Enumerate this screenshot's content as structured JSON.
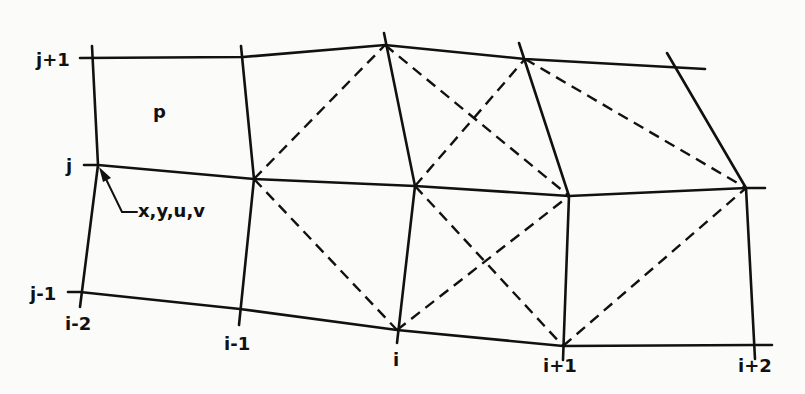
{
  "labels": {
    "row_top": "j+1",
    "row_mid": "j",
    "row_bot": "j-1",
    "col_0": "i-2",
    "col_1": "i-1",
    "col_2": "i",
    "col_3": "i+1",
    "col_4": "i+2",
    "cell": "p",
    "node_vars": "x,y,u,v"
  },
  "grid": {
    "rows": [
      "j+1",
      "j",
      "j-1"
    ],
    "columns": [
      "i-2",
      "i-1",
      "i",
      "i+1",
      "i+2"
    ]
  }
}
